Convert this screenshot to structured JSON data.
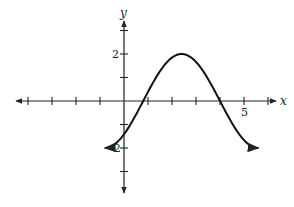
{
  "chart_data": {
    "type": "line",
    "title": "",
    "xlabel": "x",
    "ylabel": "y",
    "xlim": [
      -4,
      6
    ],
    "ylim": [
      -3,
      3
    ],
    "grid": false,
    "legend": null,
    "x_tick_labels": [
      {
        "value": 5,
        "label": "5"
      }
    ],
    "y_tick_labels": [
      {
        "value": 2,
        "label": "2"
      },
      {
        "value": -2,
        "label": "-2"
      }
    ],
    "x_ticks": [
      -4,
      -3,
      -2,
      -1,
      1,
      2,
      3,
      4,
      5,
      6
    ],
    "y_ticks": [
      -3,
      -2,
      -1,
      1,
      2,
      3
    ],
    "series": [
      {
        "name": "curve",
        "description": "sinusoid, y = -2cos(pi(x+0.8)/3.2), arrows at both ends",
        "x": [
          -0.8,
          0,
          0.8,
          1.6,
          2.4,
          3.2,
          4.0,
          4.8,
          5.6
        ],
        "values": [
          -2,
          -1.41,
          0,
          1.41,
          2,
          1.41,
          0,
          -1.41,
          -2
        ]
      }
    ],
    "annotations": {
      "minimum_points": [
        [
          -0.8,
          -2
        ],
        [
          5.6,
          -2
        ]
      ],
      "maximum_point": [
        2.4,
        2
      ],
      "x_intercepts": [
        0.8,
        4.0
      ]
    }
  },
  "labels": {
    "x_axis": "x",
    "y_axis": "y",
    "tick_five": "5",
    "tick_two": "2",
    "tick_neg_two": "-2"
  }
}
